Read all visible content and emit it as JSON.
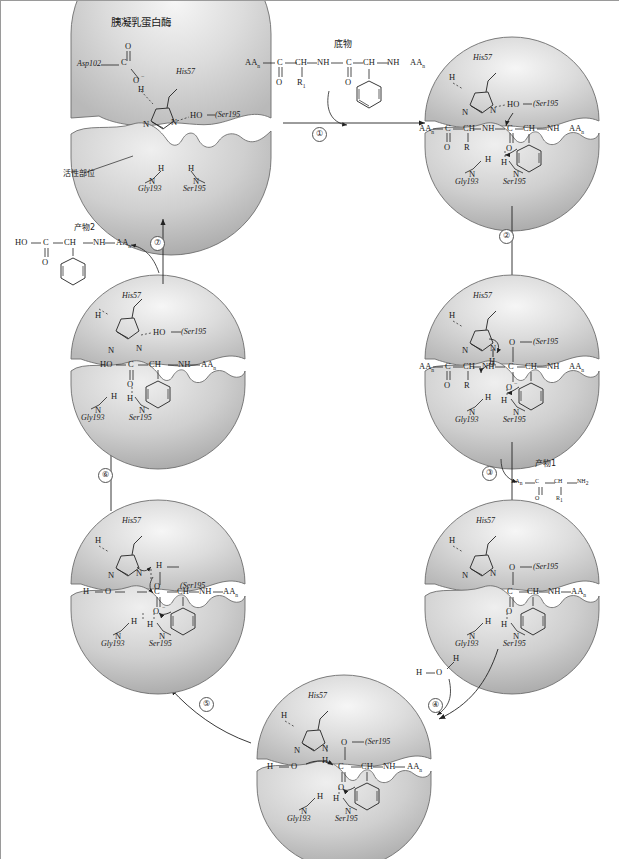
{
  "figure": {
    "title": "胰凝乳蛋白酶",
    "title_en": "Chymotrypsin",
    "active_site_label": "活性部位",
    "substrate_label": "底物",
    "product1_label": "产物1",
    "product2_label": "产物2",
    "water_label": "H2O"
  },
  "colors": {
    "enzyme_fill": "#c9c9c9",
    "enzyme_highlight": "#f2f2f2",
    "enzyme_stroke": "#6e6e6e",
    "ink": "#1a1a1a",
    "frame": "#9a9a9a"
  },
  "residues": {
    "asp102": "Asp102",
    "his57": "His57",
    "ser195": "Ser195",
    "gly193": "Gly193",
    "ser195_paren": "(Ser195"
  },
  "steps": [
    {
      "id": 1,
      "numeral": "①"
    },
    {
      "id": 2,
      "numeral": "②"
    },
    {
      "id": 3,
      "numeral": "③"
    },
    {
      "id": 4,
      "numeral": "④"
    },
    {
      "id": 5,
      "numeral": "⑤"
    },
    {
      "id": 6,
      "numeral": "⑥"
    },
    {
      "id": 7,
      "numeral": "⑦"
    }
  ],
  "atoms": {
    "C": "C",
    "O": "O",
    "N": "N",
    "H": "H",
    "CH": "CH",
    "NH": "NH",
    "NH2": "NH",
    "HO": "HO",
    "AA": "AA",
    "R": "R",
    "Oneg": "O",
    "Ominus": "−"
  },
  "substrate_chain": {
    "left_cap": "AA",
    "left_sub": "n",
    "units": [
      "C",
      "CH",
      "NH",
      "C",
      "CH",
      "NH"
    ],
    "right_cap": "AA",
    "right_sub": "n",
    "carbonyl_o": "O",
    "r_group": "R",
    "r_sub": "1"
  },
  "product1": {
    "formula": [
      "AA",
      "C",
      "CH",
      "NH"
    ],
    "sub_n": "n",
    "sub_2": "2",
    "o": "O",
    "r": "R",
    "r_sub": "1"
  },
  "product2": {
    "formula": [
      "HO",
      "C",
      "CH",
      "NH",
      "AA"
    ],
    "sub_n": "n",
    "o": "O"
  },
  "panels": [
    {
      "name": "panel-free-enzyme",
      "stage": "Free enzyme with catalytic triad",
      "position": "top-left"
    },
    {
      "name": "panel-michaelis",
      "stage": "Substrate bound, Ser195 attack",
      "position": "top-right"
    },
    {
      "name": "panel-tetrahedral-1",
      "stage": "Tetrahedral intermediate 1",
      "position": "mid-right"
    },
    {
      "name": "panel-acyl-enzyme",
      "stage": "Acyl-enzyme intermediate",
      "position": "lower-right"
    },
    {
      "name": "panel-water-attack",
      "stage": "Water attacks acyl-enzyme",
      "position": "bottom-center"
    },
    {
      "name": "panel-tetrahedral-2",
      "stage": "Tetrahedral intermediate 2",
      "position": "lower-left"
    },
    {
      "name": "panel-product-bound",
      "stage": "Product 2 still bound",
      "position": "mid-left"
    }
  ]
}
